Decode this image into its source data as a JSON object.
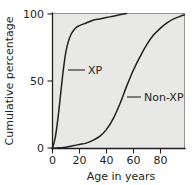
{
  "chart_data": {
    "type": "line",
    "title": "",
    "xlabel": "Age in years",
    "ylabel": "Cumulative percentage",
    "xlim": [
      0,
      98
    ],
    "ylim": [
      0,
      100
    ],
    "grid": false,
    "legend_position": "inline-annotations",
    "xticks": [
      0,
      20,
      40,
      60,
      80
    ],
    "xtick_labels": [
      "0",
      "20",
      "40",
      "60",
      "80"
    ],
    "yticks": [
      0,
      50,
      100
    ],
    "ytick_labels": [
      "0",
      "50",
      "100"
    ],
    "series": [
      {
        "name": "XP",
        "annotation": "XP",
        "x": [
          0,
          2,
          4,
          6,
          8,
          10,
          12,
          14,
          16,
          18,
          20,
          25,
          30,
          35,
          40,
          45,
          50,
          55
        ],
        "values": [
          0,
          8,
          22,
          40,
          58,
          72,
          80,
          85,
          88,
          90,
          91,
          93,
          95,
          96,
          97,
          98,
          99,
          100
        ]
      },
      {
        "name": "Non-XP",
        "annotation": "Non-XP",
        "x": [
          0,
          5,
          10,
          15,
          20,
          25,
          30,
          35,
          40,
          45,
          50,
          55,
          60,
          65,
          70,
          75,
          80,
          85,
          90,
          95,
          98
        ],
        "values": [
          0,
          0.5,
          1,
          2,
          3,
          4,
          6,
          9,
          14,
          22,
          33,
          46,
          58,
          68,
          77,
          84,
          89,
          93,
          96,
          98,
          99
        ]
      }
    ],
    "annotations": [
      {
        "label": "XP",
        "x_px": 88,
        "y_px": 70
      },
      {
        "label": "Non-XP",
        "x_px": 143,
        "y_px": 97
      }
    ],
    "colors": {
      "plot_background": "#e8e8e6",
      "curve": "#231f20",
      "axis": "#231f20",
      "page_background": "#ffffff"
    }
  }
}
